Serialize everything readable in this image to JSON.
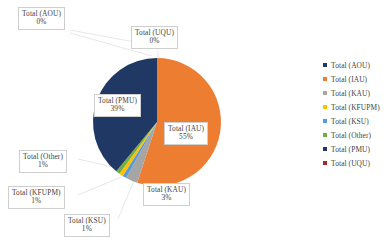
{
  "chart_data": {
    "type": "pie",
    "title": "",
    "subtitle": "",
    "xlabel": "",
    "ylabel": "",
    "grid": false,
    "legend_position": "right",
    "categories": [
      "Total (AOU)",
      "Total (IAU)",
      "Total (KAU)",
      "Total (KFUPM)",
      "Total (KSU)",
      "Total (Other)",
      "Total (PMU)",
      "Total (UQU)"
    ],
    "values": [
      0,
      55,
      3,
      1,
      1,
      1,
      39,
      0
    ],
    "value_labels": [
      "0%",
      "55%",
      "3%",
      "1%",
      "1%",
      "1%",
      "39%",
      "0%"
    ],
    "colors": [
      "#1F3864",
      "#ED7D31",
      "#A5A5A5",
      "#FFC000",
      "#5B9BD5",
      "#70AD47",
      "#203864",
      "#A02B2B"
    ]
  },
  "legend": {
    "items": [
      {
        "label": "Total (AOU)",
        "color": "#1F3864"
      },
      {
        "label": "Total (IAU)",
        "color": "#ED7D31"
      },
      {
        "label": "Total (KAU)",
        "color": "#A5A5A5"
      },
      {
        "label": "Total (KFUPM)",
        "color": "#FFC000"
      },
      {
        "label": "Total (KSU)",
        "color": "#5B9BD5"
      },
      {
        "label": "Total (Other)",
        "color": "#70AD47"
      },
      {
        "label": "Total (PMU)",
        "color": "#203864"
      },
      {
        "label": "Total (UQU)",
        "color": "#A02B2B"
      }
    ]
  },
  "callouts": {
    "aou": {
      "name": "Total (AOU)",
      "pct": "0%"
    },
    "uqu": {
      "name": "Total (UQU)",
      "pct": "0%"
    },
    "pmu": {
      "name": "Total (PMU)",
      "pct": "39%"
    },
    "iau": {
      "name": "Total (IAU)",
      "pct": "55%"
    },
    "kau": {
      "name": "Total (KAU)",
      "pct": "3%"
    },
    "other": {
      "name": "Total (Other)",
      "pct": "1%"
    },
    "kfupm": {
      "name": "Total (KFUPM)",
      "pct": "1%"
    },
    "ksu": {
      "name": "Total (KSU)",
      "pct": "1%"
    }
  }
}
